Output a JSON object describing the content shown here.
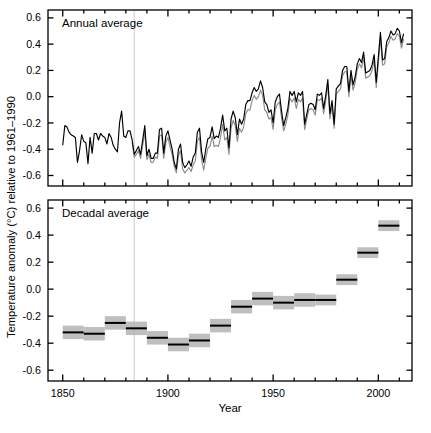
{
  "figure": {
    "y_axis_label": "Temperature anomaly (°C) relative to 1961–1990",
    "x_axis_label": "Year",
    "series_colors": {
      "primary": "#000000",
      "secondary": "#8c8c8c",
      "band": "#b4b4b4",
      "marker_line": "#d9d9d9"
    }
  },
  "panels": [
    {
      "id": "annual",
      "title": "Annual average"
    },
    {
      "id": "decadal",
      "title": "Decadal average"
    }
  ],
  "axes": {
    "y_ticks": [
      "0.6",
      "0.4",
      "0.2",
      "0.0",
      "-0.2",
      "-0.4",
      "-0.6"
    ],
    "y_tick_values": [
      0.6,
      0.4,
      0.2,
      0.0,
      -0.2,
      -0.4,
      -0.6
    ],
    "x_ticks": [
      "1850",
      "1900",
      "1950",
      "2000"
    ],
    "x_tick_values": [
      1850,
      1900,
      1950,
      2000
    ],
    "x_minor_step": 10,
    "xlim": [
      1843,
      2016
    ],
    "ylim": [
      -0.68,
      0.66
    ]
  },
  "chart_data": [
    {
      "type": "line",
      "title": "Annual average",
      "xlabel": "Year",
      "ylabel": "Temperature anomaly (°C) relative to 1961–1990",
      "xlim": [
        1843,
        2016
      ],
      "ylim": [
        -0.68,
        0.66
      ],
      "grid": false,
      "legend": "none",
      "annotations": [
        {
          "type": "vline",
          "x": 1884,
          "color": "#d9d9d9"
        }
      ],
      "x": [
        1850,
        1851,
        1852,
        1853,
        1854,
        1855,
        1856,
        1857,
        1858,
        1859,
        1860,
        1861,
        1862,
        1863,
        1864,
        1865,
        1866,
        1867,
        1868,
        1869,
        1870,
        1871,
        1872,
        1873,
        1874,
        1875,
        1876,
        1877,
        1878,
        1879,
        1880,
        1881,
        1882,
        1883,
        1884,
        1885,
        1886,
        1887,
        1888,
        1889,
        1890,
        1891,
        1892,
        1893,
        1894,
        1895,
        1896,
        1897,
        1898,
        1899,
        1900,
        1901,
        1902,
        1903,
        1904,
        1905,
        1906,
        1907,
        1908,
        1909,
        1910,
        1911,
        1912,
        1913,
        1914,
        1915,
        1916,
        1917,
        1918,
        1919,
        1920,
        1921,
        1922,
        1923,
        1924,
        1925,
        1926,
        1927,
        1928,
        1929,
        1930,
        1931,
        1932,
        1933,
        1934,
        1935,
        1936,
        1937,
        1938,
        1939,
        1940,
        1941,
        1942,
        1943,
        1944,
        1945,
        1946,
        1947,
        1948,
        1949,
        1950,
        1951,
        1952,
        1953,
        1954,
        1955,
        1956,
        1957,
        1958,
        1959,
        1960,
        1961,
        1962,
        1963,
        1964,
        1965,
        1966,
        1967,
        1968,
        1969,
        1970,
        1971,
        1972,
        1973,
        1974,
        1975,
        1976,
        1977,
        1978,
        1979,
        1980,
        1981,
        1982,
        1983,
        1984,
        1985,
        1986,
        1987,
        1988,
        1989,
        1990,
        1991,
        1992,
        1993,
        1994,
        1995,
        1996,
        1997,
        1998,
        1999,
        2000,
        2001,
        2002,
        2003,
        2004,
        2005,
        2006,
        2007,
        2008,
        2009,
        2010,
        2011,
        2012
      ],
      "series": [
        {
          "name": "HadCRUT4 annual anomaly",
          "color": "#000000",
          "values": [
            -0.37,
            -0.22,
            -0.23,
            -0.27,
            -0.29,
            -0.3,
            -0.31,
            -0.5,
            -0.41,
            -0.29,
            -0.34,
            -0.35,
            -0.51,
            -0.31,
            -0.43,
            -0.28,
            -0.28,
            -0.33,
            -0.28,
            -0.3,
            -0.31,
            -0.36,
            -0.28,
            -0.31,
            -0.37,
            -0.4,
            -0.42,
            -0.2,
            -0.11,
            -0.3,
            -0.31,
            -0.26,
            -0.26,
            -0.33,
            -0.44,
            -0.41,
            -0.38,
            -0.44,
            -0.33,
            -0.22,
            -0.45,
            -0.4,
            -0.47,
            -0.47,
            -0.43,
            -0.43,
            -0.25,
            -0.24,
            -0.43,
            -0.3,
            -0.26,
            -0.33,
            -0.4,
            -0.5,
            -0.55,
            -0.4,
            -0.36,
            -0.5,
            -0.54,
            -0.52,
            -0.49,
            -0.53,
            -0.46,
            -0.43,
            -0.27,
            -0.24,
            -0.42,
            -0.5,
            -0.4,
            -0.32,
            -0.31,
            -0.23,
            -0.32,
            -0.3,
            -0.31,
            -0.24,
            -0.14,
            -0.26,
            -0.24,
            -0.39,
            -0.17,
            -0.11,
            -0.16,
            -0.29,
            -0.17,
            -0.21,
            -0.17,
            -0.06,
            -0.03,
            -0.03,
            0.03,
            0.07,
            0.04,
            0.06,
            0.12,
            0.07,
            -0.04,
            -0.06,
            -0.12,
            -0.1,
            -0.2,
            -0.04,
            -0.0,
            0.02,
            -0.11,
            -0.22,
            -0.16,
            -0.09,
            0.04,
            0.01,
            0.04,
            -0.04,
            0.03,
            0.01,
            0.04,
            -0.21,
            -0.13,
            -0.06,
            -0.05,
            -0.06,
            -0.1,
            0.02,
            0.01,
            0.03,
            -0.09,
            0.01,
            0.13,
            -0.13,
            -0.03,
            -0.21,
            0.06,
            0.08,
            0.1,
            0.2,
            0.23,
            0.23,
            0.04,
            0.2,
            0.09,
            0.15,
            0.25,
            0.29,
            0.26,
            0.34,
            0.18,
            0.19,
            0.2,
            0.24,
            0.32,
            0.11,
            0.3,
            0.49,
            0.28,
            0.29,
            0.42,
            0.45,
            0.5,
            0.47,
            0.48,
            0.52,
            0.5,
            0.41,
            0.48,
            0.53,
            0.41,
            0.44
          ]
        },
        {
          "name": "HadCRUT4 alternative annual anomaly",
          "color": "#8c8c8c",
          "values": [
            null,
            null,
            null,
            null,
            null,
            null,
            null,
            null,
            null,
            null,
            null,
            null,
            null,
            null,
            null,
            null,
            null,
            null,
            null,
            null,
            null,
            null,
            null,
            null,
            null,
            null,
            null,
            null,
            null,
            null,
            null,
            null,
            null,
            -0.35,
            -0.46,
            -0.44,
            -0.41,
            -0.47,
            -0.37,
            -0.27,
            -0.48,
            -0.44,
            -0.5,
            -0.5,
            -0.46,
            -0.47,
            -0.3,
            -0.29,
            -0.47,
            -0.35,
            -0.31,
            -0.38,
            -0.44,
            -0.53,
            -0.58,
            -0.45,
            -0.41,
            -0.55,
            -0.58,
            -0.56,
            -0.54,
            -0.57,
            -0.52,
            -0.49,
            -0.34,
            -0.31,
            -0.48,
            -0.56,
            -0.47,
            -0.39,
            -0.38,
            -0.3,
            -0.38,
            -0.37,
            -0.38,
            -0.31,
            -0.21,
            -0.33,
            -0.31,
            -0.44,
            -0.24,
            -0.18,
            -0.22,
            -0.34,
            -0.24,
            -0.27,
            -0.23,
            -0.13,
            -0.1,
            -0.1,
            -0.03,
            0.01,
            -0.02,
            0.0,
            0.05,
            0.01,
            -0.1,
            -0.12,
            -0.17,
            -0.16,
            -0.25,
            -0.1,
            -0.06,
            -0.04,
            -0.16,
            -0.26,
            -0.21,
            -0.14,
            -0.01,
            -0.04,
            -0.01,
            -0.09,
            -0.02,
            -0.04,
            -0.01,
            -0.25,
            -0.17,
            -0.1,
            -0.09,
            -0.1,
            -0.14,
            -0.02,
            -0.03,
            -0.01,
            -0.13,
            -0.03,
            0.09,
            -0.17,
            -0.07,
            -0.24,
            0.02,
            0.04,
            0.06,
            0.16,
            0.19,
            0.19,
            0.0,
            0.16,
            0.05,
            0.11,
            0.21,
            0.25,
            0.22,
            0.3,
            0.14,
            0.15,
            0.16,
            0.2,
            0.28,
            0.07,
            0.26,
            0.45,
            0.24,
            0.25,
            0.38,
            0.41,
            0.46,
            0.43,
            0.44,
            0.48,
            0.46,
            0.37,
            0.44,
            0.49,
            0.37,
            0.4
          ]
        }
      ]
    },
    {
      "type": "bar",
      "title": "Decadal average",
      "xlabel": "Year",
      "ylabel": "Temperature anomaly (°C) relative to 1961–1990",
      "xlim": [
        1843,
        2016
      ],
      "ylim": [
        -0.68,
        0.66
      ],
      "grid": false,
      "legend": "none",
      "annotations": [
        {
          "type": "vline",
          "x": 1884,
          "color": "#d9d9d9"
        }
      ],
      "categories": [
        "1850s",
        "1860s",
        "1870s",
        "1880s",
        "1890s",
        "1900s",
        "1910s",
        "1920s",
        "1930s",
        "1940s",
        "1950s",
        "1960s",
        "1970s",
        "1980s",
        "1990s",
        "2000s"
      ],
      "decade_start": [
        1850,
        1860,
        1870,
        1880,
        1890,
        1900,
        1910,
        1920,
        1930,
        1940,
        1950,
        1960,
        1970,
        1980,
        1990,
        2000
      ],
      "decade_end": [
        1860,
        1870,
        1880,
        1890,
        1900,
        1910,
        1920,
        1930,
        1940,
        1950,
        1960,
        1970,
        1980,
        1990,
        2000,
        2010
      ],
      "values": [
        -0.32,
        -0.33,
        -0.25,
        -0.29,
        -0.36,
        -0.41,
        -0.38,
        -0.27,
        -0.13,
        -0.07,
        -0.1,
        -0.08,
        -0.08,
        0.07,
        0.27,
        0.47
      ],
      "uncertainty_low": [
        -0.37,
        -0.38,
        -0.3,
        -0.34,
        -0.41,
        -0.46,
        -0.43,
        -0.32,
        -0.18,
        -0.12,
        -0.15,
        -0.13,
        -0.12,
        0.03,
        0.23,
        0.43
      ],
      "uncertainty_high": [
        -0.27,
        -0.28,
        -0.2,
        -0.24,
        -0.31,
        -0.36,
        -0.33,
        -0.22,
        -0.08,
        -0.02,
        -0.05,
        -0.03,
        -0.04,
        0.11,
        0.31,
        0.51
      ],
      "bar_color": "#000000",
      "band_color": "#b4b4b4"
    }
  ]
}
